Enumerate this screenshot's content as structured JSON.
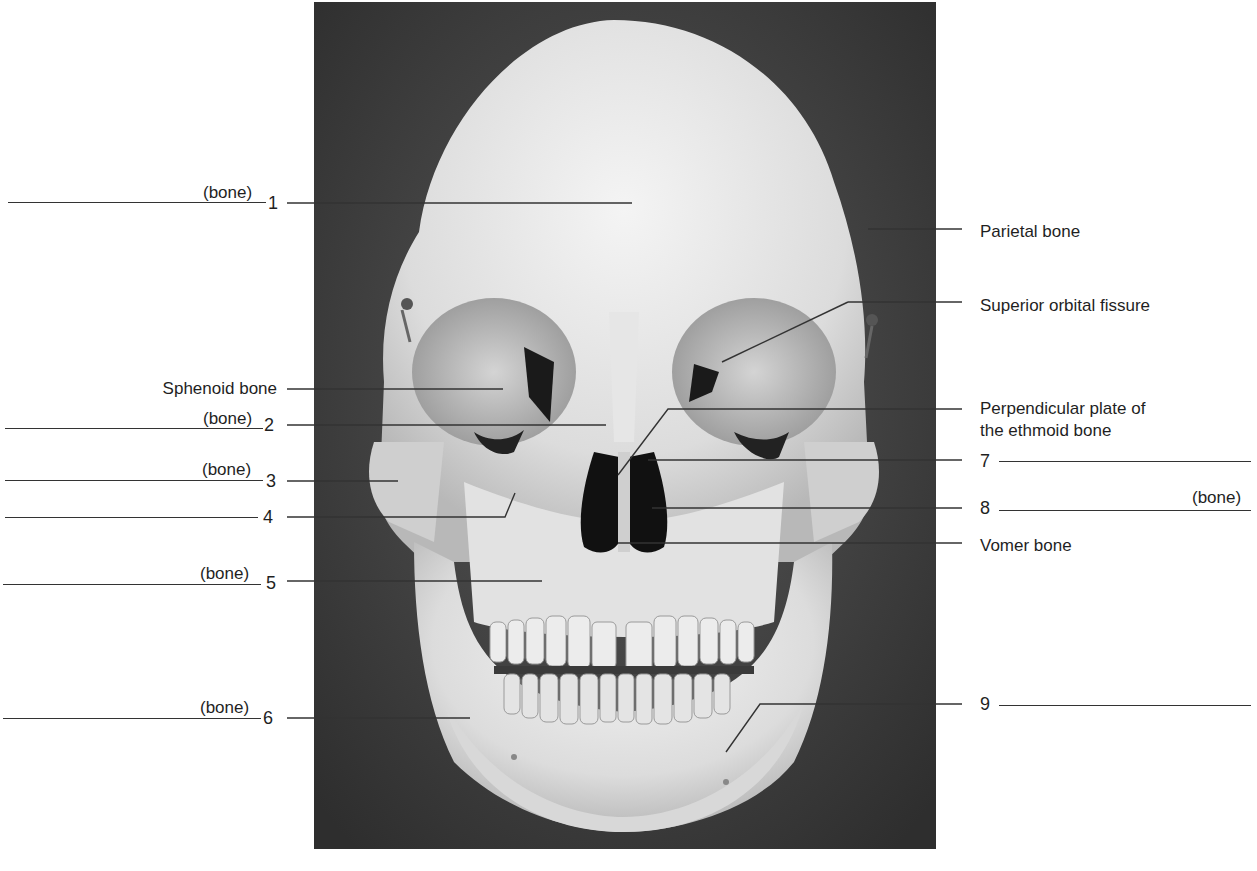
{
  "figure": {
    "photo_background": "#3a3a3a",
    "bone_color": "#e8e8e8",
    "line_color": "#333333"
  },
  "labels_left": [
    {
      "id": "1",
      "number": "1",
      "suffix": "(bone)",
      "answer": ""
    },
    {
      "id": "sphenoid",
      "text": "Sphenoid bone"
    },
    {
      "id": "2",
      "number": "2",
      "suffix": "(bone)",
      "answer": ""
    },
    {
      "id": "3",
      "number": "3",
      "suffix": "(bone)",
      "answer": ""
    },
    {
      "id": "4",
      "number": "4",
      "answer": ""
    },
    {
      "id": "5",
      "number": "5",
      "suffix": "(bone)",
      "answer": ""
    },
    {
      "id": "6",
      "number": "6",
      "suffix": "(bone)",
      "answer": ""
    }
  ],
  "labels_right": [
    {
      "id": "parietal",
      "text": "Parietal bone"
    },
    {
      "id": "sof",
      "text": "Superior orbital fissure"
    },
    {
      "id": "ppe_line1",
      "text": "Perpendicular plate of"
    },
    {
      "id": "ppe_line2",
      "text": "the ethmoid bone"
    },
    {
      "id": "7",
      "number": "7",
      "answer": ""
    },
    {
      "id": "8",
      "number": "8",
      "suffix": "(bone)",
      "answer": ""
    },
    {
      "id": "vomer",
      "text": "Vomer bone"
    },
    {
      "id": "9",
      "number": "9",
      "answer": ""
    }
  ]
}
